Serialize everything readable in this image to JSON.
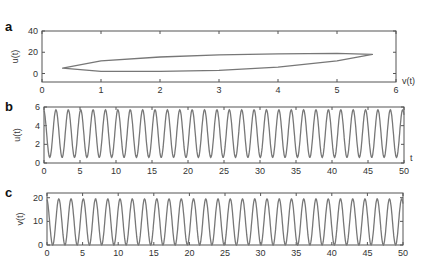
{
  "figure": {
    "panels": [
      {
        "id": "a",
        "label": "a"
      },
      {
        "id": "b",
        "label": "b"
      },
      {
        "id": "c",
        "label": "c"
      }
    ]
  },
  "chart_data": [
    {
      "panel": "a",
      "type": "line",
      "title": "",
      "xlabel": "v(t)",
      "ylabel": "u(t)",
      "xlim": [
        0,
        6
      ],
      "ylim": [
        -8,
        40
      ],
      "xticks": [
        0,
        1,
        2,
        3,
        4,
        5,
        6
      ],
      "yticks": [
        0,
        20,
        40
      ],
      "grid": false,
      "description": "Phase-plane limit cycle: u(t) vs v(t), elongated loop",
      "loop": {
        "v_min": 0.35,
        "u_at_v_min": 5,
        "v_max": 5.6,
        "u_at_v_max": 18,
        "upper_branch": [
          [
            0.35,
            5
          ],
          [
            1,
            12
          ],
          [
            2,
            15.5
          ],
          [
            3,
            17.5
          ],
          [
            4,
            18.5
          ],
          [
            5,
            19
          ],
          [
            5.6,
            18
          ]
        ],
        "lower_branch": [
          [
            0.35,
            5
          ],
          [
            1,
            2
          ],
          [
            2,
            2
          ],
          [
            3,
            3
          ],
          [
            4,
            6
          ],
          [
            5,
            12
          ],
          [
            5.6,
            18
          ]
        ]
      }
    },
    {
      "panel": "b",
      "type": "line",
      "title": "",
      "xlabel": "t",
      "ylabel": "u(t)",
      "xlim": [
        0,
        50
      ],
      "ylim": [
        0,
        6
      ],
      "xticks": [
        0,
        5,
        10,
        15,
        20,
        25,
        30,
        35,
        40,
        45,
        50
      ],
      "yticks": [
        0,
        2,
        4,
        6
      ],
      "grid": false,
      "series": [
        {
          "name": "u(t)",
          "min": 0.6,
          "max": 5.7,
          "period": 1.72
        }
      ]
    },
    {
      "panel": "c",
      "type": "line",
      "title": "",
      "xlabel": "",
      "ylabel": "v(t)",
      "xlim": [
        0,
        50
      ],
      "ylim": [
        0,
        22
      ],
      "xticks": [
        0,
        5,
        10,
        15,
        20,
        25,
        30,
        35,
        40,
        45,
        50
      ],
      "yticks": [
        0,
        10,
        20
      ],
      "grid": false,
      "series": [
        {
          "name": "v(t)",
          "min": 0,
          "max": 19.5,
          "period": 1.72
        }
      ]
    }
  ]
}
